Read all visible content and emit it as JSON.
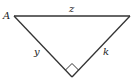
{
  "diagram": {
    "type": "right-triangle",
    "vertices": {
      "A": {
        "label": "A",
        "x": 14,
        "y": 16
      },
      "B": {
        "label": "",
        "x": 130,
        "y": 16
      },
      "C": {
        "label": "",
        "x": 72,
        "y": 77
      }
    },
    "sides": {
      "hypotenuse": {
        "label": "z",
        "from": "A",
        "to": "B"
      },
      "left_leg": {
        "label": "y",
        "from": "A",
        "to": "C"
      },
      "right_leg": {
        "label": "k",
        "from": "B",
        "to": "C"
      }
    },
    "right_angle_at": "C",
    "colors": {
      "line": "#333333",
      "background": "#ffffff"
    }
  }
}
